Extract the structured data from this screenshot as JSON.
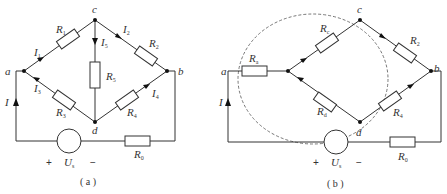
{
  "diagram_a": {
    "caption": "( a )",
    "nodes": {
      "a": "a",
      "b": "b",
      "c": "c",
      "d": "d"
    },
    "resistors": {
      "R1": {
        "main": "R",
        "sub": "1"
      },
      "R2": {
        "main": "R",
        "sub": "2"
      },
      "R3": {
        "main": "R",
        "sub": "3"
      },
      "R4": {
        "main": "R",
        "sub": "4"
      },
      "R5": {
        "main": "R",
        "sub": "5"
      },
      "R0": {
        "main": "R",
        "sub": "0"
      }
    },
    "currents": {
      "I": "I",
      "I1": {
        "main": "I",
        "sub": "1"
      },
      "I2": {
        "main": "I",
        "sub": "2"
      },
      "I3": {
        "main": "I",
        "sub": "3"
      },
      "I4": {
        "main": "I",
        "sub": "4"
      },
      "I5": {
        "main": "I",
        "sub": "5"
      }
    },
    "source": {
      "main": "U",
      "sub": "s",
      "plus": "+",
      "minus": "−"
    }
  },
  "diagram_b": {
    "caption": "( b )",
    "nodes": {
      "a": "a",
      "b": "b",
      "c": "c",
      "d": "d"
    },
    "resistors": {
      "Ra": {
        "main": "R",
        "sub": "a"
      },
      "Rc": {
        "main": "R",
        "sub": "c"
      },
      "Rd": {
        "main": "R",
        "sub": "d"
      },
      "R2": {
        "main": "R",
        "sub": "2"
      },
      "R4": {
        "main": "R",
        "sub": "4"
      },
      "R0": {
        "main": "R",
        "sub": "0"
      }
    },
    "currents": {
      "I": "I"
    },
    "source": {
      "main": "U",
      "sub": "s",
      "plus": "+",
      "minus": "−"
    }
  }
}
